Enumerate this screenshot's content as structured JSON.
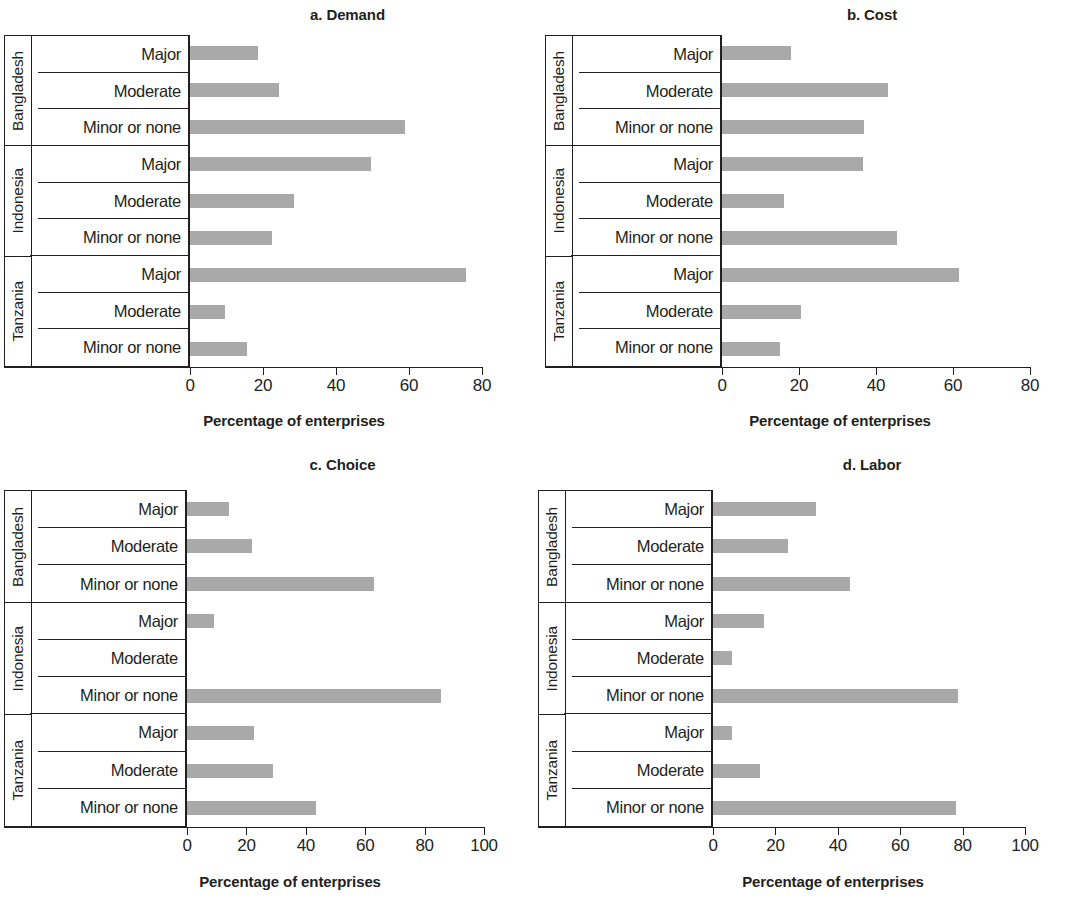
{
  "figure": {
    "axis_title": "Percentage of enterprises",
    "countries": [
      "Bangladesh",
      "Indonesia",
      "Tanzania"
    ],
    "severities": [
      "Major",
      "Moderate",
      "Minor or none"
    ],
    "bar_color": "#a9a9a9",
    "axis_color": "#231f20"
  },
  "chart_data": [
    {
      "type": "bar",
      "orientation": "horizontal",
      "panel": "a",
      "title": "a. Demand",
      "xlabel": "Percentage of enterprises",
      "ylabel": "",
      "xlim": [
        0,
        80
      ],
      "xticks": [
        0,
        20,
        40,
        60,
        80
      ],
      "grid": false,
      "legend": "none",
      "categories": [
        "Bangladesh - Major",
        "Bangladesh - Moderate",
        "Bangladesh - Minor or none",
        "Indonesia - Major",
        "Indonesia - Moderate",
        "Indonesia - Minor or none",
        "Tanzania - Major",
        "Tanzania - Moderate",
        "Tanzania - Minor or none"
      ],
      "values": [
        18.5,
        24.5,
        59,
        49.5,
        28.5,
        22.5,
        75.5,
        9.5,
        15.5
      ]
    },
    {
      "type": "bar",
      "orientation": "horizontal",
      "panel": "b",
      "title": "b. Cost",
      "xlabel": "Percentage of enterprises",
      "ylabel": "",
      "xlim": [
        0,
        80
      ],
      "xticks": [
        0,
        20,
        40,
        60,
        80
      ],
      "grid": false,
      "legend": "none",
      "categories": [
        "Bangladesh - Major",
        "Bangladesh - Moderate",
        "Bangladesh - Minor or none",
        "Indonesia - Major",
        "Indonesia - Moderate",
        "Indonesia - Minor or none",
        "Tanzania - Major",
        "Tanzania - Moderate",
        "Tanzania - Minor or none"
      ],
      "values": [
        18,
        43,
        37,
        36.5,
        16,
        45.5,
        61.5,
        20.5,
        15
      ]
    },
    {
      "type": "bar",
      "orientation": "horizontal",
      "panel": "c",
      "title": "c. Choice",
      "xlabel": "Percentage of enterprises",
      "ylabel": "",
      "xlim": [
        0,
        100
      ],
      "xticks": [
        0,
        20,
        40,
        60,
        80,
        100
      ],
      "grid": false,
      "legend": "none",
      "categories": [
        "Bangladesh - Major",
        "Bangladesh - Moderate",
        "Bangladesh - Minor or none",
        "Indonesia - Major",
        "Indonesia - Moderate",
        "Indonesia - Minor or none",
        "Tanzania - Major",
        "Tanzania - Moderate",
        "Tanzania - Minor or none"
      ],
      "values": [
        14,
        22,
        63,
        9,
        0,
        85.5,
        22.5,
        29,
        43.5
      ]
    },
    {
      "type": "bar",
      "orientation": "horizontal",
      "panel": "d",
      "title": "d. Labor",
      "xlabel": "Percentage of enterprises",
      "ylabel": "",
      "xlim": [
        0,
        100
      ],
      "xticks": [
        0,
        20,
        40,
        60,
        80,
        100
      ],
      "grid": false,
      "legend": "none",
      "categories": [
        "Bangladesh - Major",
        "Bangladesh - Moderate",
        "Bangladesh - Minor or none",
        "Indonesia - Major",
        "Indonesia - Moderate",
        "Indonesia - Minor or none",
        "Tanzania - Major",
        "Tanzania - Moderate",
        "Tanzania - Minor or none"
      ],
      "values": [
        33,
        24,
        44,
        16.5,
        6,
        78.5,
        6,
        15,
        78
      ]
    }
  ]
}
